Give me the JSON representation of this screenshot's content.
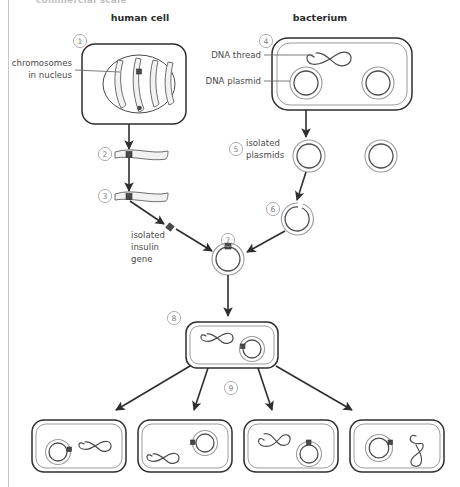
{
  "figure": {
    "cut_off_title": "commercial scale",
    "background_color": "#ffffff",
    "ink_color": "#2e2e2e",
    "accent_gray": "#9b9b9b"
  },
  "headers": [
    {
      "id": "human-cell",
      "label": "human cell",
      "x": 140,
      "y": 21
    },
    {
      "id": "bacterium",
      "label": "bacterium",
      "x": 320,
      "y": 21
    }
  ],
  "labels": [
    {
      "id": "chromosomes-in-nucleus",
      "lines": [
        "chromosomes",
        "in nucleus"
      ],
      "x": 72,
      "y": 66,
      "anchor": "end",
      "leader": {
        "x1": 75,
        "y1": 70,
        "x2": 120,
        "y2": 70
      }
    },
    {
      "id": "dna-thread",
      "lines": [
        "DNA thread"
      ],
      "x": 261,
      "y": 58,
      "anchor": "end",
      "leader": {
        "x1": 264,
        "y1": 55,
        "x2": 313,
        "y2": 55
      }
    },
    {
      "id": "dna-plasmid",
      "lines": [
        "DNA plasmid"
      ],
      "x": 261,
      "y": 84,
      "anchor": "end",
      "leader": {
        "x1": 264,
        "y1": 81,
        "x2": 295,
        "y2": 81
      }
    },
    {
      "id": "isolated-plasmids",
      "lines": [
        "isolated",
        "plasmids"
      ],
      "x": 246,
      "y": 146,
      "anchor": "start",
      "leader": null
    },
    {
      "id": "isolated-insulin-gene",
      "lines": [
        "isolated",
        "insulin",
        "gene"
      ],
      "x": 131,
      "y": 238,
      "anchor": "start",
      "leader": null
    }
  ],
  "steps": [
    {
      "number": "1",
      "glyph": "①",
      "x": 80,
      "y": 41,
      "describes": "human-cell-with-nucleus"
    },
    {
      "number": "2",
      "glyph": "②",
      "x": 105,
      "y": 154,
      "describes": "extracted-chromosome"
    },
    {
      "number": "3",
      "glyph": "③",
      "x": 105,
      "y": 196,
      "describes": "chromosome-being-cut"
    },
    {
      "number": "4",
      "glyph": "④",
      "x": 266,
      "y": 41,
      "describes": "bacterium-with-plasmids"
    },
    {
      "number": "5",
      "glyph": "⑤",
      "x": 236,
      "y": 149,
      "describes": "isolated-plasmids"
    },
    {
      "number": "6",
      "glyph": "⑥",
      "x": 273,
      "y": 209,
      "describes": "opened-plasmid"
    },
    {
      "number": "7",
      "glyph": "⑦",
      "x": 228,
      "y": 240,
      "describes": "recombinant-plasmid"
    },
    {
      "number": "8",
      "glyph": "⑧",
      "x": 174,
      "y": 318,
      "describes": "transformed-bacterium"
    },
    {
      "number": "9",
      "glyph": "⑨",
      "x": 231,
      "y": 388,
      "describes": "bacterial-replication"
    }
  ],
  "cells": {
    "human_cell": {
      "id": "human-cell-body",
      "x": 82,
      "y": 44,
      "width": 104,
      "height": 80,
      "nucleus": {
        "cx": 139,
        "cy": 84,
        "rx": 36,
        "ry": 29
      },
      "chromosome_count": 4,
      "gene_marker_on_chromosome": 2
    },
    "bacterium_top": {
      "id": "bacterium-body",
      "x": 272,
      "y": 38,
      "width": 140,
      "height": 72,
      "dna_thread_count": 1,
      "plasmid_count": 2
    },
    "bacterium_transformed": {
      "id": "transformed-bacterium-body",
      "x": 186,
      "y": 322,
      "width": 92,
      "height": 46,
      "dna_thread_count": 1,
      "plasmid_count": 1,
      "plasmid_has_gene": true
    },
    "offspring": [
      {
        "id": "offspring-cell-1",
        "x": 32,
        "y": 420,
        "width": 94,
        "height": 52,
        "plasmid_side": "left",
        "plasmid_has_gene": true
      },
      {
        "id": "offspring-cell-2",
        "x": 138,
        "y": 420,
        "width": 94,
        "height": 52,
        "plasmid_side": "right",
        "plasmid_has_gene": true
      },
      {
        "id": "offspring-cell-3",
        "x": 244,
        "y": 420,
        "width": 94,
        "height": 52,
        "plasmid_side": "right",
        "plasmid_has_gene": true
      },
      {
        "id": "offspring-cell-4",
        "x": 350,
        "y": 420,
        "width": 94,
        "height": 52,
        "plasmid_side": "left",
        "plasmid_has_gene": true
      }
    ]
  },
  "free_plasmids": [
    {
      "id": "isolated-plasmid-a",
      "cx": 309,
      "cy": 156,
      "r": 13,
      "open": false
    },
    {
      "id": "isolated-plasmid-b",
      "cx": 381,
      "cy": 156,
      "r": 13,
      "open": false
    },
    {
      "id": "opened-plasmid",
      "cx": 297,
      "cy": 219,
      "r": 13,
      "open": true
    },
    {
      "id": "recombinant-plasmid",
      "cx": 228,
      "cy": 259,
      "r": 14,
      "open": false,
      "has_gene": true
    }
  ],
  "arrows": [
    {
      "id": "arrow-human-to-step2",
      "from": "human-cell",
      "to": "extracted-chromosome"
    },
    {
      "id": "arrow-step2-to-step3",
      "from": "extracted-chromosome",
      "to": "cut-chromosome"
    },
    {
      "id": "arrow-gene-to-plasmid",
      "from": "cut-chromosome",
      "to": "recombinant-plasmid"
    },
    {
      "id": "arrow-bacterium-to-plasmids",
      "from": "bacterium",
      "to": "isolated-plasmids"
    },
    {
      "id": "arrow-plasmid-to-open",
      "from": "isolated-plasmid",
      "to": "opened-plasmid"
    },
    {
      "id": "arrow-open-to-recombinant",
      "from": "opened-plasmid",
      "to": "recombinant-plasmid"
    },
    {
      "id": "arrow-recombinant-to-host",
      "from": "recombinant-plasmid",
      "to": "transformed-bacterium"
    },
    {
      "id": "arrow-host-to-offspring-1",
      "from": "transformed-bacterium",
      "to": "offspring-cell-1"
    },
    {
      "id": "arrow-host-to-offspring-2",
      "from": "transformed-bacterium",
      "to": "offspring-cell-2"
    },
    {
      "id": "arrow-host-to-offspring-3",
      "from": "transformed-bacterium",
      "to": "offspring-cell-3"
    },
    {
      "id": "arrow-host-to-offspring-4",
      "from": "transformed-bacterium",
      "to": "offspring-cell-4"
    }
  ]
}
